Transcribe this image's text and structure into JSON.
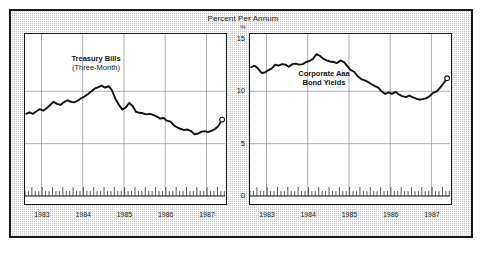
{
  "figure": {
    "title": "Percent Per Annum",
    "unit_symbol": "%",
    "frame_color": "#1a1a1a",
    "background_color": "#c9c9c9",
    "panel_background": "#ffffff",
    "line_color": "#111111"
  },
  "yaxis": {
    "ticks": [
      "15",
      "10",
      "5",
      "0"
    ],
    "min": 0,
    "max": 15
  },
  "xaxis": {
    "ticks": [
      "1983",
      "1984",
      "1985",
      "1986",
      "1987"
    ],
    "min": 1982.6,
    "max": 1987.45
  },
  "panels": [
    {
      "id": "left",
      "caption_line1": "Treasury Bills",
      "caption_line2": "(Three-Month)"
    },
    {
      "id": "right",
      "caption_line1": "Corporate Aaa",
      "caption_line2": "Bond Yields"
    }
  ],
  "chart_data": [
    {
      "type": "line",
      "title": "Treasury Bills (Three-Month)",
      "subtitle": "Percent Per Annum",
      "xlabel": "",
      "ylabel": "%",
      "xlim": [
        1982.6,
        1987.45
      ],
      "ylim": [
        0,
        15
      ],
      "yticks": [
        0,
        5,
        10,
        15
      ],
      "xticks": [
        1983,
        1984,
        1985,
        1986,
        1987
      ],
      "grid": true,
      "legend": "none",
      "endpoint_marker": "open-circle",
      "series": [
        {
          "name": "Treasury Bills (Three-Month)",
          "x": [
            1982.63,
            1982.71,
            1982.79,
            1982.88,
            1982.96,
            1983.04,
            1983.13,
            1983.21,
            1983.29,
            1983.38,
            1983.46,
            1983.54,
            1983.63,
            1983.71,
            1983.79,
            1983.88,
            1983.96,
            1984.04,
            1984.13,
            1984.21,
            1984.29,
            1984.38,
            1984.46,
            1984.54,
            1984.63,
            1984.71,
            1984.79,
            1984.88,
            1984.96,
            1985.04,
            1985.13,
            1985.21,
            1985.29,
            1985.38,
            1985.46,
            1985.54,
            1985.63,
            1985.71,
            1985.79,
            1985.88,
            1985.96,
            1986.04,
            1986.13,
            1986.21,
            1986.29,
            1986.38,
            1986.46,
            1986.54,
            1986.63,
            1986.71,
            1986.79,
            1986.88,
            1986.96,
            1987.04,
            1987.13,
            1987.21,
            1987.29,
            1987.38
          ],
          "y": [
            7.85,
            8.0,
            7.85,
            8.1,
            8.3,
            8.15,
            8.4,
            8.7,
            9.0,
            8.8,
            8.7,
            8.95,
            9.15,
            9.0,
            8.95,
            9.1,
            9.35,
            9.5,
            9.75,
            10.0,
            10.25,
            10.4,
            10.55,
            10.35,
            10.5,
            10.1,
            9.3,
            8.7,
            8.25,
            8.45,
            8.9,
            8.6,
            8.05,
            7.95,
            7.9,
            7.8,
            7.85,
            7.75,
            7.6,
            7.4,
            7.45,
            7.2,
            7.1,
            6.75,
            6.55,
            6.4,
            6.3,
            6.35,
            6.2,
            5.9,
            5.95,
            6.15,
            6.2,
            6.1,
            6.25,
            6.4,
            6.7,
            7.3
          ]
        }
      ]
    },
    {
      "type": "line",
      "title": "Corporate Aaa Bond Yields",
      "subtitle": "Percent Per Annum",
      "xlabel": "",
      "ylabel": "%",
      "xlim": [
        1982.6,
        1987.45
      ],
      "ylim": [
        0,
        15
      ],
      "yticks": [
        0,
        5,
        10,
        15
      ],
      "xticks": [
        1983,
        1984,
        1985,
        1986,
        1987
      ],
      "grid": true,
      "legend": "none",
      "endpoint_marker": "open-circle",
      "series": [
        {
          "name": "Corporate Aaa Bond Yields",
          "x": [
            1982.63,
            1982.71,
            1982.79,
            1982.88,
            1982.96,
            1983.04,
            1983.13,
            1983.21,
            1983.29,
            1983.38,
            1983.46,
            1983.54,
            1983.63,
            1983.71,
            1983.79,
            1983.88,
            1983.96,
            1984.04,
            1984.13,
            1984.21,
            1984.29,
            1984.38,
            1984.46,
            1984.54,
            1984.63,
            1984.71,
            1984.79,
            1984.88,
            1984.96,
            1985.04,
            1985.13,
            1985.21,
            1985.29,
            1985.38,
            1985.46,
            1985.54,
            1985.63,
            1985.71,
            1985.79,
            1985.88,
            1985.96,
            1986.04,
            1986.13,
            1986.21,
            1986.29,
            1986.38,
            1986.46,
            1986.54,
            1986.63,
            1986.71,
            1986.79,
            1986.88,
            1986.96,
            1987.04,
            1987.13,
            1987.21,
            1987.29,
            1987.38
          ],
          "y": [
            12.3,
            12.45,
            12.2,
            11.75,
            11.8,
            12.0,
            12.2,
            12.55,
            12.45,
            12.6,
            12.55,
            12.35,
            12.6,
            12.65,
            12.55,
            12.6,
            12.8,
            12.9,
            13.1,
            13.55,
            13.4,
            13.1,
            12.95,
            12.85,
            12.8,
            12.7,
            12.95,
            12.8,
            12.4,
            12.05,
            11.85,
            11.45,
            11.2,
            11.05,
            10.9,
            10.7,
            10.5,
            10.35,
            10.0,
            9.75,
            9.9,
            9.75,
            9.95,
            9.7,
            9.55,
            9.45,
            9.6,
            9.45,
            9.3,
            9.2,
            9.25,
            9.35,
            9.55,
            9.85,
            10.0,
            10.35,
            10.75,
            11.25
          ]
        }
      ]
    }
  ]
}
